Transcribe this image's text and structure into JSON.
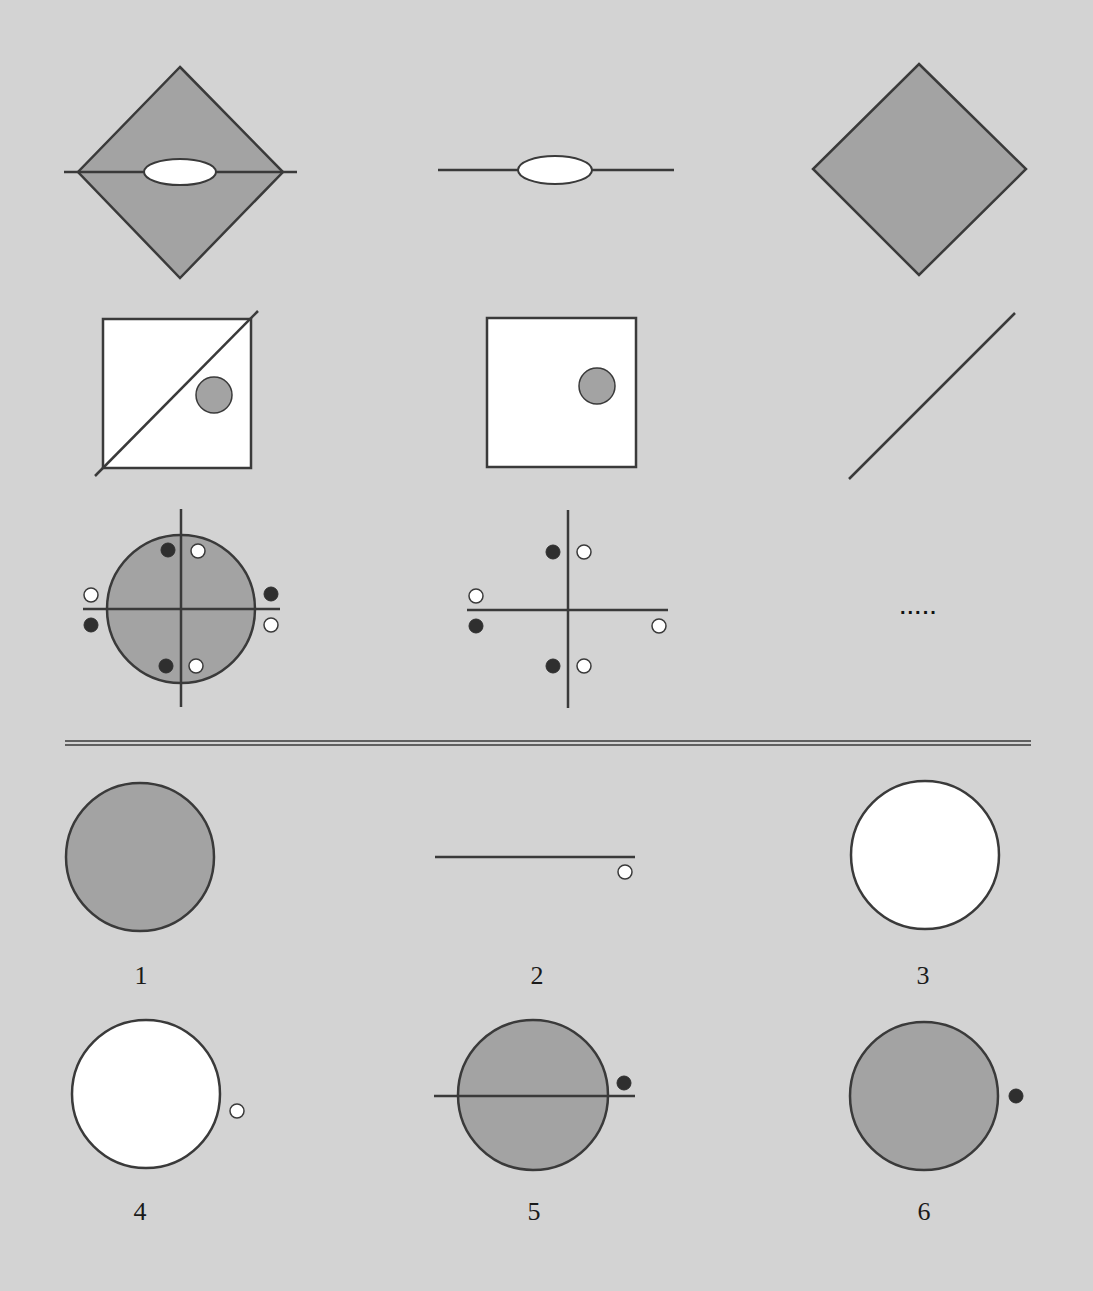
{
  "colors": {
    "background": "#d3d3d3",
    "shape_gray": "#a3a3a3",
    "stroke": "#3a3a3a",
    "white": "#ffffff",
    "dot_dark": "#2f2f2f"
  },
  "puzzle": {
    "rows": [
      {
        "cells": [
          {
            "description": "gray diamond with horizontal line through center and white ellipse"
          },
          {
            "description": "horizontal line with white ellipse"
          },
          {
            "description": "gray diamond"
          }
        ]
      },
      {
        "cells": [
          {
            "description": "white square with diagonal line and small gray circle"
          },
          {
            "description": "white square with small gray circle"
          },
          {
            "description": "diagonal line"
          }
        ]
      },
      {
        "cells": [
          {
            "description": "gray circle with cross axes and paired black/white dots"
          },
          {
            "description": "cross axes with paired black/white dots"
          },
          {
            "description": "missing",
            "placeholder": "....."
          }
        ]
      }
    ]
  },
  "answers": {
    "options": [
      {
        "label": "1",
        "description": "gray circle"
      },
      {
        "label": "2",
        "description": "horizontal line with white dot below right end"
      },
      {
        "label": "3",
        "description": "white circle"
      },
      {
        "label": "4",
        "description": "white circle with small white dot on right"
      },
      {
        "label": "5",
        "description": "gray circle with horizontal line and black dot above right"
      },
      {
        "label": "6",
        "description": "gray circle with black dot on right"
      }
    ]
  }
}
